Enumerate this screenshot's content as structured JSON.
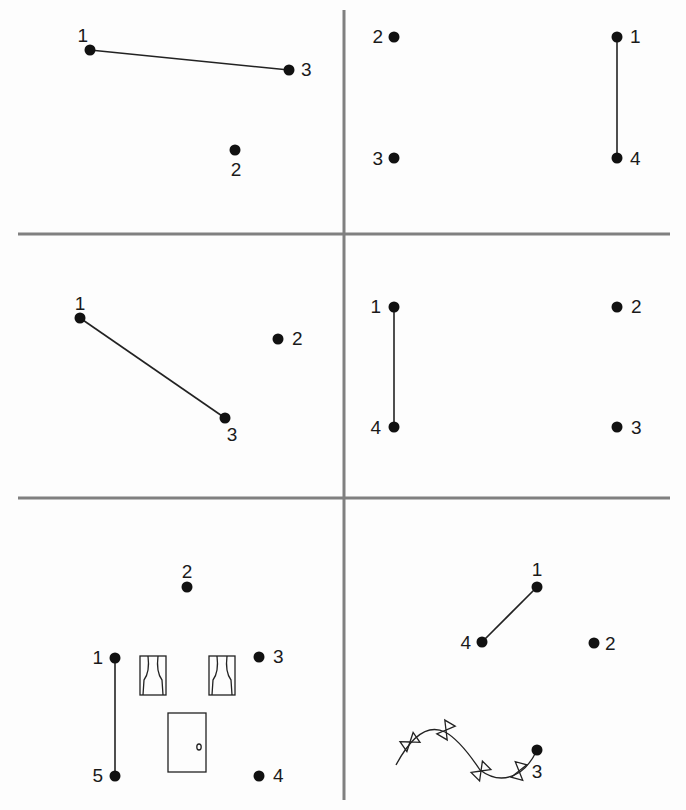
{
  "worksheet": {
    "grid_color": "#808080",
    "ink_color": "#111111",
    "grid": {
      "vertical_x": 344,
      "horizontal_y": [
        234,
        498
      ],
      "left": 18,
      "right": 670,
      "top": 10,
      "bottom": 800
    },
    "panels": [
      {
        "id": "top-left",
        "dots": [
          {
            "label": "1",
            "x": 90,
            "y": 50,
            "lx": 88,
            "ly": 42,
            "anchor": "end-top"
          },
          {
            "label": "2",
            "x": 235,
            "y": 150,
            "lx": 236,
            "ly": 176,
            "anchor": "middle"
          },
          {
            "label": "3",
            "x": 289,
            "y": 70,
            "lx": 301,
            "ly": 76,
            "anchor": "start"
          }
        ],
        "drawn_segments": [
          [
            "1",
            "3"
          ]
        ]
      },
      {
        "id": "top-right",
        "dots": [
          {
            "label": "1",
            "x": 617,
            "y": 37,
            "lx": 630,
            "ly": 43,
            "anchor": "start"
          },
          {
            "label": "2",
            "x": 394,
            "y": 37,
            "lx": 383,
            "ly": 43,
            "anchor": "end"
          },
          {
            "label": "3",
            "x": 394,
            "y": 158,
            "lx": 383,
            "ly": 165,
            "anchor": "end"
          },
          {
            "label": "4",
            "x": 617,
            "y": 158,
            "lx": 630,
            "ly": 165,
            "anchor": "start"
          }
        ],
        "drawn_segments": [
          [
            "1",
            "4"
          ]
        ]
      },
      {
        "id": "middle-left",
        "dots": [
          {
            "label": "1",
            "x": 80,
            "y": 318,
            "lx": 80,
            "ly": 310,
            "anchor": "middle"
          },
          {
            "label": "2",
            "x": 278,
            "y": 339,
            "lx": 292,
            "ly": 345,
            "anchor": "start"
          },
          {
            "label": "3",
            "x": 225,
            "y": 418,
            "lx": 232,
            "ly": 441,
            "anchor": "middle"
          }
        ],
        "drawn_segments": [
          [
            "1",
            "3"
          ]
        ]
      },
      {
        "id": "middle-right",
        "dots": [
          {
            "label": "1",
            "x": 394,
            "y": 307,
            "lx": 381,
            "ly": 313,
            "anchor": "end"
          },
          {
            "label": "2",
            "x": 617,
            "y": 307,
            "lx": 631,
            "ly": 313,
            "anchor": "start"
          },
          {
            "label": "3",
            "x": 617,
            "y": 427,
            "lx": 631,
            "ly": 434,
            "anchor": "start"
          },
          {
            "label": "4",
            "x": 394,
            "y": 427,
            "lx": 381,
            "ly": 434,
            "anchor": "end"
          }
        ],
        "drawn_segments": [
          [
            "1",
            "4"
          ]
        ]
      },
      {
        "id": "bottom-left",
        "dots": [
          {
            "label": "1",
            "x": 115,
            "y": 658,
            "lx": 103,
            "ly": 664,
            "anchor": "end"
          },
          {
            "label": "2",
            "x": 187,
            "y": 587,
            "lx": 187,
            "ly": 578,
            "anchor": "middle"
          },
          {
            "label": "3",
            "x": 259,
            "y": 657,
            "lx": 273,
            "ly": 663,
            "anchor": "start"
          },
          {
            "label": "4",
            "x": 259,
            "y": 776,
            "lx": 273,
            "ly": 782,
            "anchor": "start"
          },
          {
            "label": "5",
            "x": 115,
            "y": 776,
            "lx": 103,
            "ly": 782,
            "anchor": "end"
          }
        ],
        "drawn_segments": [
          [
            "1",
            "5"
          ]
        ],
        "decorations": [
          "window-left",
          "window-right",
          "door"
        ]
      },
      {
        "id": "bottom-right",
        "dots": [
          {
            "label": "1",
            "x": 537,
            "y": 587,
            "lx": 537,
            "ly": 576,
            "anchor": "middle"
          },
          {
            "label": "2",
            "x": 594,
            "y": 643,
            "lx": 605,
            "ly": 650,
            "anchor": "start"
          },
          {
            "label": "3",
            "x": 537,
            "y": 750,
            "lx": 537,
            "ly": 778,
            "anchor": "middle"
          },
          {
            "label": "4",
            "x": 482,
            "y": 642,
            "lx": 471,
            "ly": 649,
            "anchor": "end"
          }
        ],
        "drawn_segments": [
          [
            "1",
            "4"
          ]
        ],
        "decorations": [
          "bunting-string"
        ]
      }
    ]
  }
}
